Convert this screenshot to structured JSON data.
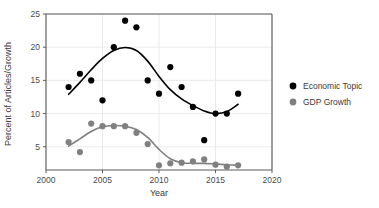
{
  "chart_data": {
    "type": "scatter",
    "title": "",
    "xlabel": "Year",
    "ylabel": "Percent of Articles/Growth",
    "xlim": [
      2000,
      2020
    ],
    "ylim": [
      1.5,
      25
    ],
    "xticks": [
      2000,
      2005,
      2010,
      2015,
      2020
    ],
    "yticks": [
      5,
      10,
      15,
      20,
      25
    ],
    "xtick_labels": [
      "2000",
      "2005",
      "2010",
      "2015",
      "2020"
    ],
    "ytick_labels": [
      "5",
      "10",
      "15",
      "20",
      "25"
    ],
    "grid": true,
    "legend_position": "right",
    "x": [
      2002,
      2003,
      2004,
      2005,
      2006,
      2007,
      2008,
      2009,
      2010,
      2011,
      2012,
      2013,
      2014,
      2015,
      2016,
      2017
    ],
    "series": [
      {
        "name": "Economic Topic",
        "color": "#000000",
        "marker": "circle",
        "has_smooth_fit": true,
        "values": [
          14,
          16,
          15,
          12,
          20,
          24,
          23,
          15,
          13,
          17,
          14,
          11,
          6,
          10,
          10,
          13
        ],
        "fit_values": [
          12.9,
          14.7,
          16.6,
          18.3,
          19.5,
          19.95,
          19.5,
          17.9,
          15.6,
          13.6,
          12.2,
          11.2,
          10.4,
          10.0,
          10.3,
          11.4
        ]
      },
      {
        "name": "GDP Growth",
        "color": "#808080",
        "marker": "circle",
        "has_smooth_fit": true,
        "values": [
          5.7,
          4.2,
          8.5,
          8.1,
          8.1,
          8.1,
          7.1,
          5.4,
          2.2,
          2.5,
          2.6,
          2.8,
          3.1,
          2.3,
          2.0,
          2.2
        ],
        "fit_values": [
          5.1,
          6.2,
          7.3,
          8.0,
          8.2,
          8.1,
          7.6,
          6.4,
          4.6,
          3.2,
          2.6,
          2.5,
          2.5,
          2.4,
          2.3,
          2.2
        ]
      }
    ]
  },
  "legend": {
    "entries": [
      {
        "label": "Economic Topic",
        "color": "#000000"
      },
      {
        "label": "GDP Growth",
        "color": "#808080"
      }
    ]
  },
  "axes": {
    "x_title": "Year",
    "y_title": "Percent of Articles/Growth"
  }
}
